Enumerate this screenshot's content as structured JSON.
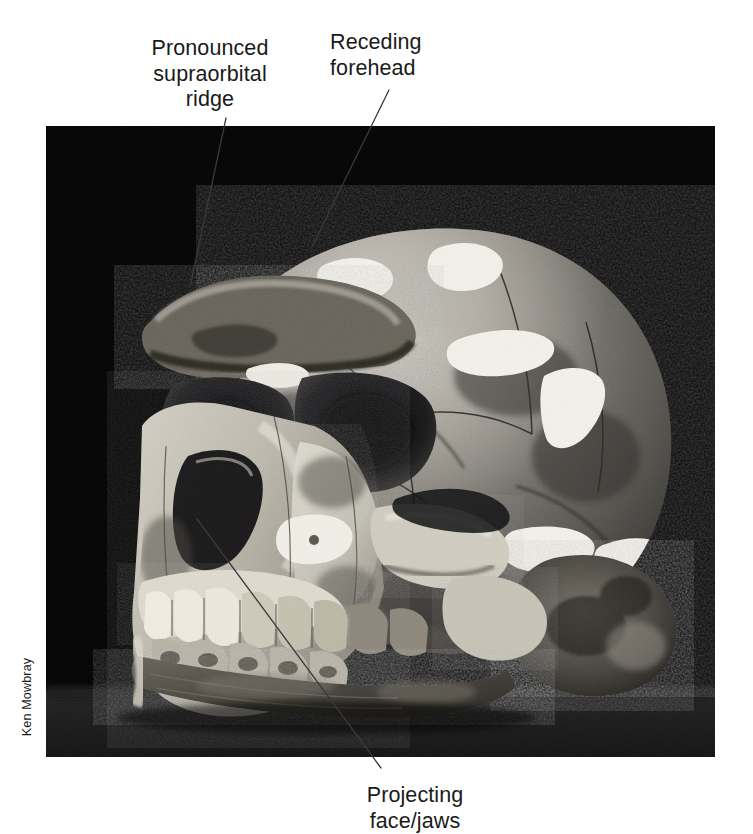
{
  "figure": {
    "kind": "photograph",
    "background": "#ffffff",
    "photo": {
      "x": 46,
      "y": 126,
      "width": 669,
      "height": 631,
      "background_color": "#000000",
      "surface_color": "#2a2a2a"
    }
  },
  "credit": {
    "text": "Ken Mowbray",
    "orientation": "rotated-90-ccw",
    "color": "#1c1c1c"
  },
  "annotations": [
    {
      "id": "supraorbital",
      "text": "Pronounced\nsupraorbital\nridge",
      "align": "center",
      "leader": {
        "x1": 226,
        "y1": 118,
        "x2": 190,
        "y2": 287
      }
    },
    {
      "id": "forehead",
      "text": "Receding\nforehead",
      "align": "left",
      "leader": {
        "x1": 389,
        "y1": 90,
        "x2": 312,
        "y2": 247
      }
    },
    {
      "id": "face-jaws",
      "text": "Projecting\nface/jaws",
      "align": "center",
      "leader": {
        "x1": 197,
        "y1": 519,
        "x2": 381,
        "y2": 768
      }
    }
  ],
  "style": {
    "label_color": "#1a1a1a",
    "label_size_px": 21.5,
    "leader_color": "#3a3a3a",
    "leader_width_px": 1.3
  }
}
